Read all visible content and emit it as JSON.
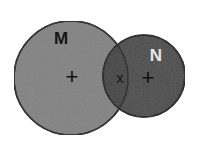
{
  "figure": {
    "background_color": "#ffffff",
    "width": 200,
    "height": 150
  },
  "sets": [
    {
      "id": "set-m",
      "label": "M",
      "label_color": "#141414",
      "fill_color": "#828282",
      "stroke_color": "#1c1c1c",
      "cx": 71,
      "cy": 78,
      "r": 57,
      "label_x": 61,
      "label_y": 44
    },
    {
      "id": "set-n",
      "label": "N",
      "label_color": "#e8e8e8",
      "fill_color": "#4a4a4a",
      "stroke_color": "#141414",
      "cx": 144,
      "cy": 76,
      "r": 41,
      "label_x": 156,
      "label_y": 61
    }
  ],
  "intersection": {
    "id": "set-intersection",
    "fill_color": "#414141",
    "stroke_color": "#141414"
  },
  "markers": [
    {
      "id": "marker-m-center",
      "glyph": "+",
      "color": "#101010",
      "x": 72,
      "y": 77,
      "size": 22,
      "region": "M only"
    },
    {
      "id": "marker-intersection",
      "glyph": "x",
      "color": "#141414",
      "x": 120,
      "y": 78,
      "size": 14,
      "region": "M and N"
    },
    {
      "id": "marker-n-center",
      "glyph": "+",
      "color": "#101010",
      "x": 148,
      "y": 78,
      "size": 22,
      "region": "N only"
    }
  ]
}
